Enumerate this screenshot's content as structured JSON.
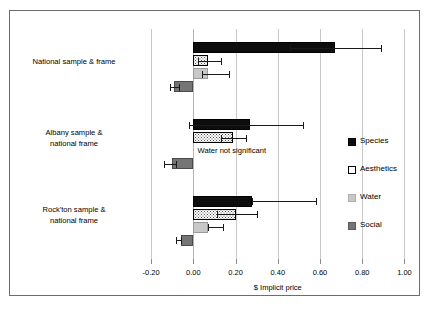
{
  "chart_data": {
    "type": "bar",
    "orientation": "horizontal",
    "title": "",
    "xlabel": "$ Implicit price",
    "ylabel": "",
    "xlim": [
      -0.3,
      1.05
    ],
    "xticks": [
      -0.2,
      0.0,
      0.2,
      0.4,
      0.6,
      0.8,
      1.0
    ],
    "xticklabels": [
      "-0.20",
      "0.00",
      "0.20",
      "0.40",
      "0.60",
      "0.80",
      "1.00"
    ],
    "grid": true,
    "legend_position": "right",
    "categories": [
      "National sample & frame",
      "Albany sample & national frame",
      "Rock'ton sample & national frame"
    ],
    "series": [
      {
        "name": "Species",
        "color": "#0d0d0d",
        "values": [
          0.67,
          0.27,
          0.28
        ],
        "err_low": [
          0.46,
          -0.02,
          0.28
        ],
        "err_high": [
          0.89,
          0.52,
          0.58
        ]
      },
      {
        "name": "Aesthetics",
        "color": "#ffffff",
        "values": [
          0.07,
          0.19,
          0.2
        ],
        "err_low": [
          0.02,
          0.13,
          0.11
        ],
        "err_high": [
          0.13,
          0.25,
          0.3
        ]
      },
      {
        "name": "Water",
        "color": "#c8c8c8",
        "values": [
          0.07,
          null,
          0.07
        ],
        "err_low": [
          0.04,
          null,
          0.07
        ],
        "err_high": [
          0.17,
          null,
          0.14
        ]
      },
      {
        "name": "Social",
        "color": "#757575",
        "values": [
          -0.09,
          -0.1,
          -0.06
        ],
        "err_low": [
          -0.11,
          -0.14,
          -0.08
        ],
        "err_high": [
          -0.07,
          -0.08,
          -0.06
        ]
      }
    ],
    "annotations": [
      {
        "text": "Water not significant",
        "x": 0.02,
        "category_index": 1
      }
    ]
  },
  "axis": {
    "title": "$ Implicit price"
  },
  "legend": {
    "items": [
      {
        "label": "Species",
        "swatch": "species-swatch"
      },
      {
        "label": "Aesthetics",
        "swatch": "aesthetics-swatch"
      },
      {
        "label": "Water",
        "swatch": "water-swatch"
      },
      {
        "label": "Social",
        "swatch": "social-swatch"
      }
    ]
  },
  "annotation": {
    "water_note": "Water not significant"
  }
}
